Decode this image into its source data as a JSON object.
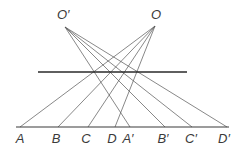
{
  "diagram": {
    "centers": [
      {
        "id": "O_prime",
        "label": "O′",
        "x": 65,
        "y": 27,
        "label_x": 57,
        "label_y": 19
      },
      {
        "id": "O",
        "label": "O",
        "x": 155,
        "y": 26,
        "label_x": 151,
        "label_y": 19
      }
    ],
    "plane_line": {
      "x1": 38,
      "y1": 72,
      "x2": 187,
      "y2": 72
    },
    "baseline": {
      "x1": 16,
      "y1": 127,
      "x2": 229,
      "y2": 127
    },
    "points": [
      {
        "label": "A",
        "x": 20,
        "label_x": 20,
        "from": "O"
      },
      {
        "label": "B",
        "x": 58,
        "label_x": 56,
        "from": "O"
      },
      {
        "label": "C",
        "x": 88,
        "label_x": 86,
        "from": "O"
      },
      {
        "label": "D",
        "x": 115,
        "label_x": 112,
        "from": "O"
      },
      {
        "label": "A′",
        "x": 130,
        "label_x": 128,
        "from": "O_prime"
      },
      {
        "label": "B′",
        "x": 165,
        "label_x": 163,
        "from": "O_prime"
      },
      {
        "label": "C′",
        "x": 192,
        "label_x": 191,
        "from": "O_prime"
      },
      {
        "label": "D′",
        "x": 227,
        "label_x": 224,
        "from": "O_prime"
      }
    ],
    "label_y": 143,
    "colors": {
      "ink": "#3a3a3a",
      "ray": "#555555",
      "background": "#ffffff"
    }
  }
}
